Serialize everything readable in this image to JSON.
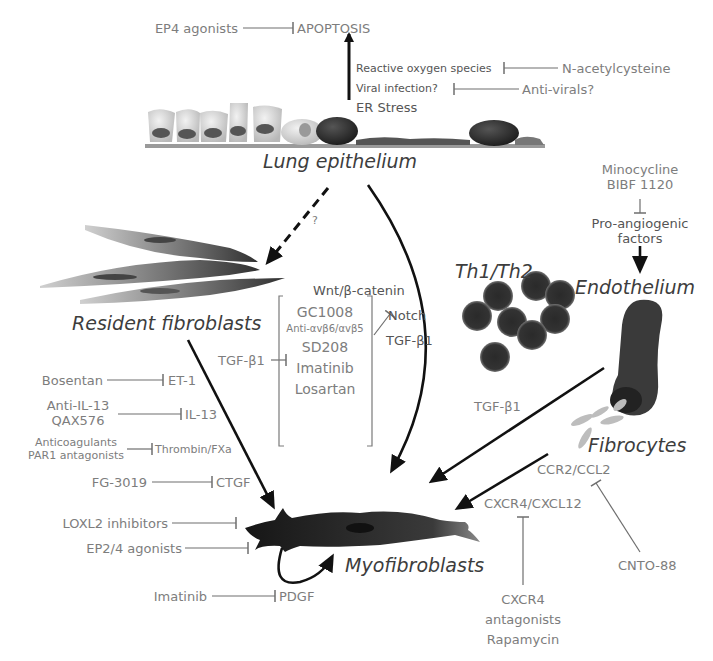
{
  "diagram": {
    "type": "pathway-diagram",
    "colors": {
      "text_gray": "#7d7d7d",
      "cell_label": "#3d3d3d",
      "arrow": "#111111",
      "inhibit_line": "#6e6e6e",
      "background": "#ffffff"
    },
    "cells": {
      "lung_epithelium": "Lung epithelium",
      "resident_fibroblasts": "Resident fibroblasts",
      "th_cells": "Th1/Th2",
      "endothelium": "Endothelium",
      "fibrocytes": "Fibrocytes",
      "myofibroblasts": "Myofibroblasts"
    },
    "apoptosis": {
      "target": "APOPTOSIS",
      "inhibitor": "EP4 agonists",
      "triggers": [
        "Reactive oxygen species",
        "Viral infection?",
        "ER Stress"
      ],
      "trigger_inhibitors": [
        "N-acetylcysteine",
        "Anti-virals?"
      ]
    },
    "epithelium_to_fibroblast": {
      "label": "?"
    },
    "angiogenesis": {
      "inhibitors": [
        "Minocycline",
        "BIBF 1120"
      ],
      "target": "Pro-angiogenic factors",
      "target_lines": [
        "Pro-angiogenic",
        "factors"
      ]
    },
    "epithelial_signals": {
      "wnt": "Wnt/β-catenin",
      "notch": "Notch",
      "tgf": "TGF-β1"
    },
    "tgf_inhibitors": {
      "target": "TGF-β1",
      "drugs": [
        "GC1008",
        "Anti-αvβ6/αvβ5",
        "SD208",
        "Imatinib",
        "Losartan"
      ]
    },
    "fibroblast_mediators": [
      {
        "drug": "Bosentan",
        "target": "ET-1"
      },
      {
        "drug_lines": [
          "Anti-IL-13",
          "QAX576"
        ],
        "target": "IL-13"
      },
      {
        "drug_lines": [
          "Anticoagulants",
          "PAR1 antagonists"
        ],
        "target": "Thrombin/FXa"
      },
      {
        "drug": "FG-3019",
        "target": "CTGF"
      }
    ],
    "myofibroblast_inhibitors": [
      "LOXL2 inhibitors",
      "EP2/4 agonists"
    ],
    "pdgf": {
      "drug": "Imatinib",
      "target": "PDGF"
    },
    "endothelium_signal": "TGF-β1",
    "fibrocyte_axes": {
      "ccr2": {
        "label": "CCR2/CCL2",
        "inhibitor": "CNTO-88"
      },
      "cxcr4": {
        "label": "CXCR4/CXCL12",
        "inhibitor_lines": [
          "CXCR4",
          "antagonists",
          "Rapamycin"
        ]
      }
    }
  }
}
